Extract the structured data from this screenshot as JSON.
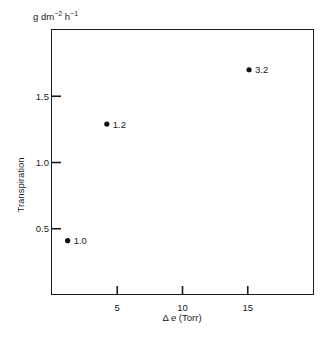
{
  "page_header": "",
  "chart_data": {
    "type": "scatter",
    "title": "",
    "xlabel": "Δe (Torr)",
    "ylabel": "Transpiration",
    "y_unit": "g dm⁻² h⁻¹",
    "xlim": [
      0,
      20
    ],
    "ylim": [
      0,
      2.0
    ],
    "x_ticks": [
      5,
      10,
      15
    ],
    "y_ticks": [
      0.5,
      1.0,
      1.5
    ],
    "grid": false,
    "legend": null,
    "points": [
      {
        "x": 1.2,
        "y": 0.41,
        "label": "1.0"
      },
      {
        "x": 4.2,
        "y": 1.29,
        "label": "1.2"
      },
      {
        "x": 15.1,
        "y": 1.7,
        "label": "3.2"
      }
    ],
    "note": "Point coordinates are estimated from pixel positions; labels are as printed beside each point"
  },
  "labels": {
    "unit_main": "g dm",
    "unit_exp1": "−2",
    "unit_h": " h",
    "unit_exp2": "−1",
    "ylabel": "Transpiration",
    "xlabel_delta": "Δ ",
    "xlabel_var": "e",
    "xlabel_unit": " (Torr)"
  }
}
